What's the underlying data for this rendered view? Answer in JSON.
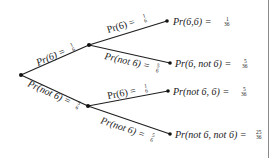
{
  "diagram": {
    "type": "probability-tree",
    "nodes": {
      "root": {
        "x": 21,
        "y": 75
      },
      "upper": {
        "x": 89,
        "y": 45
      },
      "lower": {
        "x": 88,
        "y": 106
      },
      "leaf1": {
        "x": 167,
        "y": 21
      },
      "leaf2": {
        "x": 170,
        "y": 63
      },
      "leaf3": {
        "x": 168,
        "y": 91
      },
      "leaf4": {
        "x": 170,
        "y": 134
      }
    },
    "branches": [
      {
        "id": "root-upper",
        "text": "Pr(6) = ",
        "num": "1",
        "den": "6"
      },
      {
        "id": "root-lower",
        "text": "Pr(not 6) = ",
        "num": "5",
        "den": "6"
      },
      {
        "id": "upper-leaf1",
        "text": "Pr(6) = ",
        "num": "1",
        "den": "6"
      },
      {
        "id": "upper-leaf2",
        "text": "Pr(not 6) = ",
        "num": "5",
        "den": "6"
      },
      {
        "id": "lower-leaf3",
        "text": "Pr(6) = ",
        "num": "1",
        "den": "6"
      },
      {
        "id": "lower-leaf4",
        "text": "Pr(not 6) = ",
        "num": "5",
        "den": "6"
      }
    ],
    "outcomes": [
      {
        "text": "Pr(6,6) = ",
        "num": "1",
        "den": "36"
      },
      {
        "text": "Pr(6, not 6) = ",
        "num": "5",
        "den": "36"
      },
      {
        "text": "Pr(not 6, 6) = ",
        "num": "5",
        "den": "36"
      },
      {
        "text": "Pr(not 6, not 6) = ",
        "num": "25",
        "den": "36"
      }
    ],
    "colors": {
      "line": "#1f1f1f",
      "text": "#1a1a1a",
      "border": "#8a8a8a",
      "background": "#ffffff"
    }
  }
}
